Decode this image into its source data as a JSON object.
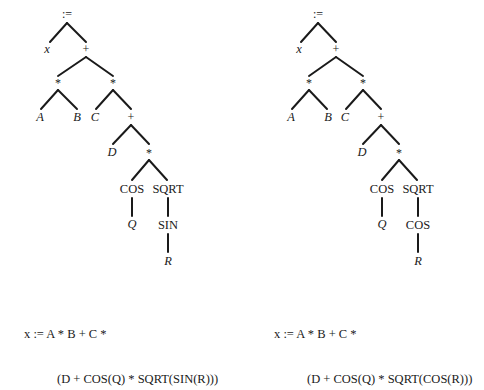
{
  "diagrams": [
    {
      "id": "left",
      "nodes": {
        "assign": ":=",
        "x": "x",
        "plus1": "+",
        "mul1": "*",
        "mul2": "*",
        "A": "A",
        "B": "B",
        "C": "C",
        "plus2": "+",
        "D": "D",
        "mul3": "*",
        "cos": "COS",
        "sqrt": "SQRT",
        "Q": "Q",
        "inner": "SIN",
        "R": "R"
      },
      "formula": {
        "line1": "x := A * B + C *",
        "line2": "(D + COS(Q) * SQRT(SIN(R)))"
      }
    },
    {
      "id": "right",
      "nodes": {
        "assign": ":=",
        "x": "x",
        "plus1": "+",
        "mul1": "*",
        "mul2": "*",
        "A": "A",
        "B": "B",
        "C": "C",
        "plus2": "+",
        "D": "D",
        "mul3": "*",
        "cos": "COS",
        "sqrt": "SQRT",
        "Q": "Q",
        "inner": "COS",
        "R": "R"
      },
      "formula": {
        "line1": "x := A * B + C *",
        "line2": "(D + COS(Q) * SQRT(COS(R)))"
      }
    }
  ]
}
